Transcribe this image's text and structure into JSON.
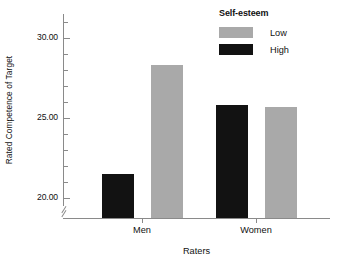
{
  "chart_data": {
    "type": "bar",
    "title": "",
    "xlabel": "Raters",
    "ylabel": "Rated Competence of Target",
    "categories": [
      "Men",
      "Women"
    ],
    "ytick_labels": [
      "30.00",
      "25.00",
      "20.00"
    ],
    "ytick_values": [
      30,
      25,
      20
    ],
    "ylim": [
      19.2,
      31.0
    ],
    "y_minor_tick_interval": 1,
    "grid": false,
    "axis_break": true,
    "legend": {
      "title": "Self-esteem",
      "position": "top-right",
      "entries": [
        {
          "label": "Low",
          "color": "#a9a9a9"
        },
        {
          "label": "High",
          "color": "#121212"
        }
      ]
    },
    "series": [
      {
        "name": "Low",
        "color": "#a9a9a9",
        "values": [
          28.3,
          25.7
        ]
      },
      {
        "name": "High",
        "color": "#121212",
        "values": [
          21.5,
          25.8
        ]
      }
    ],
    "bars": [
      {
        "category": "Men",
        "series": "High",
        "value": 21.5,
        "color": "#121212"
      },
      {
        "category": "Men",
        "series": "Low",
        "value": 28.3,
        "color": "#a9a9a9"
      },
      {
        "category": "Women",
        "series": "High",
        "value": 25.8,
        "color": "#121212"
      },
      {
        "category": "Women",
        "series": "Low",
        "value": 25.7,
        "color": "#a9a9a9"
      }
    ]
  },
  "axes": {
    "y_title": "Rated Competence of Target",
    "x_title": "Raters",
    "y_ticks": [
      {
        "label": "30.00",
        "value": 30
      },
      {
        "label": "25.00",
        "value": 25
      },
      {
        "label": "20.00",
        "value": 20
      }
    ],
    "x_ticks": [
      {
        "label": "Men"
      },
      {
        "label": "Women"
      }
    ]
  },
  "legend": {
    "title": "Self-esteem",
    "rows": [
      {
        "label": "Low"
      },
      {
        "label": "High"
      }
    ]
  },
  "colors": {
    "low": "#a9a9a9",
    "high": "#121212",
    "axis": "#8a8a8a",
    "text": "#111111",
    "background": "#ffffff"
  }
}
